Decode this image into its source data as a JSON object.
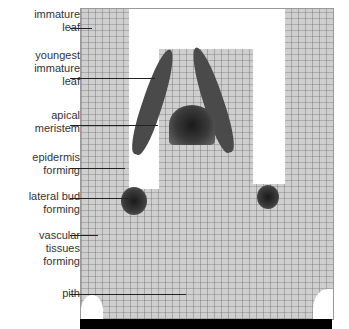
{
  "figure": {
    "labels": [
      {
        "id": "immature-leaf",
        "text": "immature\nleaf"
      },
      {
        "id": "youngest-immature-leaf",
        "text": "youngest\nimmature\nleaf"
      },
      {
        "id": "apical-meristem",
        "text": "apical\nmeristem"
      },
      {
        "id": "epidermis-forming",
        "text": "epidermis\nforming"
      },
      {
        "id": "lateral-bud-forming",
        "text": "lateral bud\nforming"
      },
      {
        "id": "vascular-tissues-forming",
        "text": "vascular\ntissues\nforming"
      },
      {
        "id": "pith",
        "text": "pith"
      }
    ]
  }
}
